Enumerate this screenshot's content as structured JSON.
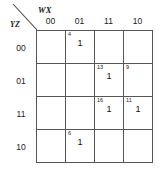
{
  "diagram": {
    "type": "karnaugh-map",
    "variables": {
      "column_axis_label": "WX",
      "row_axis_label": "YZ"
    },
    "column_headers": [
      "00",
      "01",
      "11",
      "10"
    ],
    "row_headers": [
      "00",
      "01",
      "11",
      "10"
    ],
    "cells": [
      {
        "row": 0,
        "col": 0,
        "index": "",
        "value": "",
        "state": "empty"
      },
      {
        "row": 0,
        "col": 1,
        "index": "4",
        "value": "1",
        "state": "filled"
      },
      {
        "row": 0,
        "col": 2,
        "index": "",
        "value": "",
        "state": "empty"
      },
      {
        "row": 0,
        "col": 3,
        "index": "",
        "value": "",
        "state": "empty"
      },
      {
        "row": 1,
        "col": 0,
        "index": "",
        "value": "",
        "state": "empty"
      },
      {
        "row": 1,
        "col": 1,
        "index": "",
        "value": "",
        "state": "empty"
      },
      {
        "row": 1,
        "col": 2,
        "index": "13",
        "value": "1",
        "state": "filled"
      },
      {
        "row": 1,
        "col": 3,
        "index": "9",
        "value": "",
        "state": "novalue"
      },
      {
        "row": 2,
        "col": 0,
        "index": "",
        "value": "",
        "state": "empty"
      },
      {
        "row": 2,
        "col": 1,
        "index": "",
        "value": "",
        "state": "empty"
      },
      {
        "row": 2,
        "col": 2,
        "index": "16",
        "value": "1",
        "state": "filled"
      },
      {
        "row": 2,
        "col": 3,
        "index": "11",
        "value": "1",
        "state": "filled"
      },
      {
        "row": 3,
        "col": 0,
        "index": "",
        "value": "",
        "state": "empty"
      },
      {
        "row": 3,
        "col": 1,
        "index": "6",
        "value": "1",
        "state": "filled"
      },
      {
        "row": 3,
        "col": 2,
        "index": "",
        "value": "",
        "state": "empty"
      },
      {
        "row": 3,
        "col": 3,
        "index": "",
        "value": "",
        "state": "empty"
      }
    ],
    "colors": {
      "grid_line": "#555555",
      "background": "#ffffff",
      "text": "#111111"
    }
  }
}
